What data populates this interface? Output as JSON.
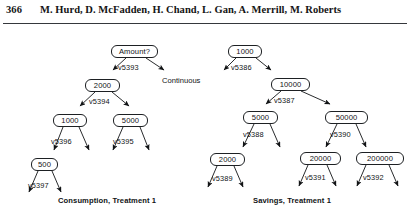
{
  "running_head": {
    "folio": "366",
    "authors": "M. Hurd, D. McFadden, H. Chand, L. Gan, A. Merrill, M. Roberts"
  },
  "figure": {
    "trees": [
      {
        "id": "consumption-tree",
        "caption": "Consumption, Treatment 1",
        "nodes": [
          {
            "id": "c-root",
            "label": "Amount?",
            "x": 111,
            "y": 19,
            "w": 47
          },
          {
            "id": "c-2000",
            "label": "2000",
            "x": 85,
            "y": 53,
            "w": 35
          },
          {
            "id": "c-1000",
            "label": "1000",
            "x": 53,
            "y": 88,
            "w": 34
          },
          {
            "id": "c-5000",
            "label": "5000",
            "x": 113,
            "y": 88,
            "w": 35
          },
          {
            "id": "c-500",
            "label": "500",
            "x": 31,
            "y": 132,
            "w": 27
          }
        ],
        "edge_labels": [
          {
            "id": "v5393",
            "label": "v5393",
            "x": 118,
            "y": 37
          },
          {
            "id": "v5394",
            "label": "v5394",
            "x": 89,
            "y": 71
          },
          {
            "id": "v5396",
            "label": "v5396",
            "x": 51,
            "y": 111
          },
          {
            "id": "v5395",
            "label": "v5395",
            "x": 113,
            "y": 111
          },
          {
            "id": "v5397",
            "label": "v5397",
            "x": 28,
            "y": 155
          }
        ],
        "terminals": [
          {
            "id": "continuous",
            "label": "Continuous",
            "x": 162,
            "y": 50
          }
        ]
      },
      {
        "id": "savings-tree",
        "caption": "Savings, Treatment 1",
        "nodes": [
          {
            "id": "s-1000",
            "label": "1000",
            "x": 228,
            "y": 19,
            "w": 34
          },
          {
            "id": "s-10000",
            "label": "10000",
            "x": 271,
            "y": 52,
            "w": 39
          },
          {
            "id": "s-5000",
            "label": "5000",
            "x": 243,
            "y": 85,
            "w": 35
          },
          {
            "id": "s-50000",
            "label": "50000",
            "x": 325,
            "y": 85,
            "w": 43
          },
          {
            "id": "s-2000",
            "label": "2000",
            "x": 210,
            "y": 127,
            "w": 35
          },
          {
            "id": "s-20000",
            "label": "20000",
            "x": 300,
            "y": 126,
            "w": 41
          },
          {
            "id": "s-200000",
            "label": "200000",
            "x": 356,
            "y": 126,
            "w": 48
          }
        ],
        "edge_labels": [
          {
            "id": "v5386",
            "label": "v5386",
            "x": 231,
            "y": 37
          },
          {
            "id": "v5387",
            "label": "v5387",
            "x": 274,
            "y": 70
          },
          {
            "id": "v5388",
            "label": "v5388",
            "x": 243,
            "y": 104
          },
          {
            "id": "v5390",
            "label": "v5390",
            "x": 330,
            "y": 104
          },
          {
            "id": "v5389",
            "label": "v5389",
            "x": 212,
            "y": 148
          },
          {
            "id": "v5391",
            "label": "v5391",
            "x": 305,
            "y": 147
          },
          {
            "id": "v5392",
            "label": "v5392",
            "x": 363,
            "y": 147
          }
        ],
        "terminals": []
      }
    ],
    "captions": [
      {
        "id": "consumption-caption",
        "label": "Consumption, Treatment 1",
        "x": 58,
        "y": 170
      },
      {
        "id": "savings-caption",
        "label": "Savings, Treatment 1",
        "x": 253,
        "y": 170
      }
    ]
  },
  "colors": {
    "ink": "#111315",
    "rule": "#35383c",
    "paper": "#ffffff"
  }
}
